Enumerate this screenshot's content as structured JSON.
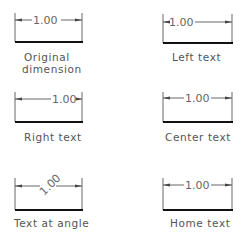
{
  "panels": [
    {
      "id": "original",
      "value": "1.00",
      "caption_line1": "Original",
      "caption_line2": "dimension"
    },
    {
      "id": "left",
      "value": "1.00",
      "caption_line1": "Left text"
    },
    {
      "id": "right",
      "value": "1.00",
      "caption_line1": "Right text"
    },
    {
      "id": "center",
      "value": "1.00",
      "caption_line1": "Center text"
    },
    {
      "id": "angle",
      "value": "1.00",
      "caption_line1": "Text at angle"
    },
    {
      "id": "home",
      "value": "1.00",
      "caption_line1": "Home text"
    }
  ],
  "colors": {
    "line": "#555555",
    "baseline": "#111111",
    "text": "#666666"
  }
}
